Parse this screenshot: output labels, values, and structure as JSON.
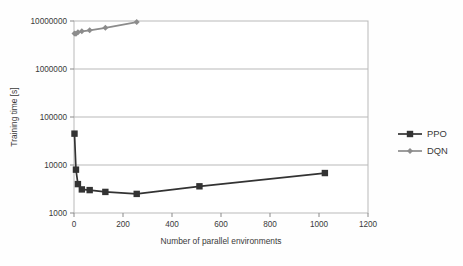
{
  "chart_data": {
    "type": "line",
    "title": "",
    "xlabel": "Number of parallel environments",
    "ylabel": "Training time [s]",
    "xlim": [
      0,
      1200
    ],
    "ylim": [
      1000,
      10000000
    ],
    "yscale": "log",
    "xscale": "linear",
    "grid": true,
    "legend_position": "right",
    "xticks": [
      0,
      200,
      400,
      600,
      800,
      1000,
      1200
    ],
    "xtick_labels": [
      "0",
      "200",
      "400",
      "600",
      "800",
      "1000",
      "1200"
    ],
    "yticks": [
      1000,
      10000,
      100000,
      1000000,
      10000000
    ],
    "ytick_labels": [
      "1000",
      "10000",
      "100000",
      "1000000",
      "10000000"
    ],
    "series": [
      {
        "name": "PPO",
        "color": "#333333",
        "marker": "square",
        "x": [
          2,
          8,
          16,
          32,
          64,
          128,
          256,
          512,
          1024
        ],
        "y": [
          45000,
          8000,
          4000,
          3100,
          3000,
          2750,
          2500,
          3600,
          6800
        ]
      },
      {
        "name": "DQN",
        "color": "#8c8c8c",
        "marker": "diamond",
        "x": [
          2,
          8,
          16,
          32,
          64,
          128,
          256
        ],
        "y": [
          5500000,
          5400000,
          5800000,
          6100000,
          6400000,
          7200000,
          9500000
        ]
      }
    ]
  },
  "legend": {
    "entries": [
      {
        "label": "PPO"
      },
      {
        "label": "DQN"
      }
    ]
  },
  "axes": {
    "x_title": "Number of parallel environments",
    "y_title": "Training time [s]"
  }
}
